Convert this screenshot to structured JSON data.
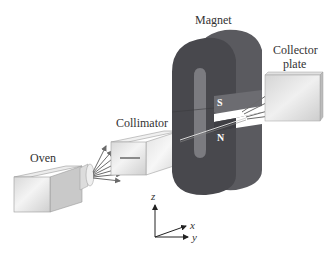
{
  "diagram": {
    "labels": {
      "magnet": "Magnet",
      "collector_line1": "Collector",
      "collector_line2": "plate",
      "collimator": "Collimator",
      "oven": "Oven",
      "south_pole": "S",
      "north_pole": "N"
    },
    "axes": {
      "z": "z",
      "x": "x",
      "y": "y"
    },
    "colors": {
      "magnet_dark": "#4a4a4f",
      "magnet_mid": "#5d5d62",
      "magnet_inner": "#7b7b80",
      "box_light": "#e6e6e6",
      "box_shade": "#c8c8c8",
      "arrow": "#6a6a6a"
    },
    "beam_counts": {
      "oven_rays": 7,
      "split_rays": 4
    }
  }
}
